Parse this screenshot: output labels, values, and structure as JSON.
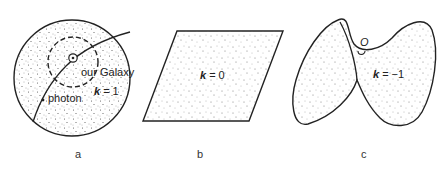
{
  "figure": {
    "panels": [
      {
        "id": "a",
        "caption": "a",
        "shape": "sphere (closed)",
        "curvature_symbol": "k",
        "curvature_value": "= 1",
        "labels": {
          "galaxy": "our Galaxy",
          "photon": "photon"
        }
      },
      {
        "id": "b",
        "caption": "b",
        "shape": "flat plane",
        "curvature_symbol": "k",
        "curvature_value": "= 0"
      },
      {
        "id": "c",
        "caption": "c",
        "shape": "saddle (open)",
        "curvature_symbol": "k",
        "curvature_value": "= −1",
        "labels": {
          "origin": "O"
        }
      }
    ],
    "colors": {
      "stroke": "#222222",
      "dots": "#555555",
      "background": "#ffffff"
    }
  }
}
